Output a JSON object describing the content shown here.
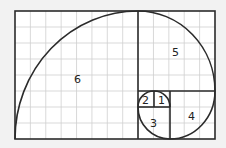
{
  "diagram": {
    "background": "#f2f2f2",
    "grid_color": "#c8c8c8",
    "line_color": "#333333",
    "squares": [
      {
        "label": "1",
        "size": 1
      },
      {
        "label": "2",
        "size": 1
      },
      {
        "label": "3",
        "size": 2
      },
      {
        "label": "4",
        "size": 3
      },
      {
        "label": "5",
        "size": 5
      },
      {
        "label": "6",
        "size": 8
      }
    ],
    "grid": {
      "columns": 13,
      "rows": 8
    }
  }
}
